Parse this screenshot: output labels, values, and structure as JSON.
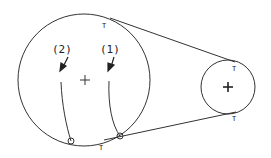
{
  "diagram": {
    "type": "belt-pulley",
    "large_pulley": {
      "cx": 84,
      "cy": 79,
      "r": 66
    },
    "small_pulley": {
      "cx": 228,
      "cy": 87,
      "r": 27
    },
    "labels": {
      "path2": "(2)",
      "path1": "(1)",
      "t_top_large": "T",
      "t_top_small": "T",
      "t_bottom_small": "T",
      "t_bottom_large": "T"
    },
    "stroke_color": "#333333"
  }
}
